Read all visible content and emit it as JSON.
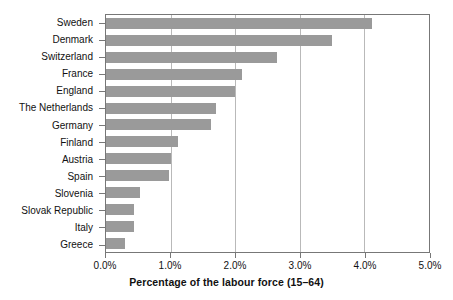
{
  "chart_data": {
    "type": "bar",
    "orientation": "horizontal",
    "title": "",
    "xlabel": "Percentage of the labour force (15–64)",
    "ylabel": "",
    "xlim": [
      0,
      5
    ],
    "xtick_labels": [
      "0.0%",
      "1.0%",
      "2.0%",
      "3.0%",
      "4.0%",
      "5.0%"
    ],
    "xtick_values": [
      0,
      1,
      2,
      3,
      4,
      5
    ],
    "grid": true,
    "legend": "none",
    "bar_color": "#9a9a9a",
    "axis_color": "#777777",
    "gridline_color": "#b9b9b9",
    "categories": [
      "Sweden",
      "Denmark",
      "Switzerland",
      "France",
      "England",
      "The Netherlands",
      "Germany",
      "Finland",
      "Austria",
      "Spain",
      "Slovenia",
      "Slovak Republic",
      "Italy",
      "Greece"
    ],
    "values": [
      4.12,
      3.5,
      2.65,
      2.1,
      2.0,
      1.7,
      1.62,
      1.12,
      1.0,
      0.97,
      0.52,
      0.43,
      0.43,
      0.3
    ],
    "units": "percent"
  }
}
